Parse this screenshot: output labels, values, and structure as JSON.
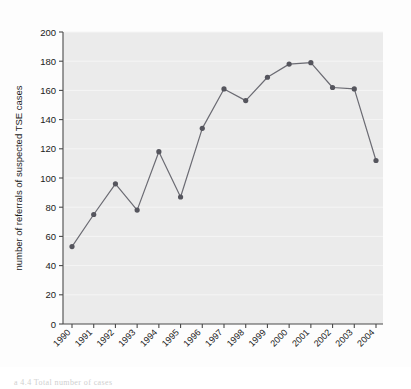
{
  "chart_data": {
    "type": "line",
    "title": "",
    "xlabel": "year",
    "ylabel": "number of referrals of suspected TSE cases",
    "categories": [
      "1990",
      "1991",
      "1992",
      "1993",
      "1994",
      "1995",
      "1996",
      "1997",
      "1998",
      "1999",
      "2000",
      "2001",
      "2002",
      "2003",
      "2004"
    ],
    "values": [
      53,
      75,
      96,
      78,
      118,
      87,
      134,
      161,
      153,
      169,
      178,
      179,
      162,
      161,
      112
    ],
    "series": [
      {
        "name": "referrals of suspected TSE cases",
        "values": [
          53,
          75,
          96,
          78,
          118,
          87,
          134,
          161,
          153,
          169,
          178,
          179,
          162,
          161,
          112
        ]
      }
    ],
    "ylim": [
      0,
      200
    ],
    "yticks": [
      0,
      20,
      40,
      60,
      80,
      100,
      120,
      140,
      160,
      180,
      200
    ],
    "ytick_labels": [
      "0",
      "20",
      "40",
      "60",
      "80",
      "100",
      "120",
      "140",
      "160",
      "180",
      "200"
    ],
    "xtick_labels": [
      "1990",
      "1991",
      "1992",
      "1993",
      "1994",
      "1995",
      "1996",
      "1997",
      "1998",
      "1999",
      "2000",
      "2001",
      "2002",
      "2003",
      "2004"
    ],
    "xtick_rotation_deg": 45,
    "grid": "horizontal",
    "legend": "none",
    "marker": "circle",
    "line_color": "#6b6b73",
    "marker_color": "#55555d",
    "plot_background": "#ebebeb",
    "gridline_color": "#f5f5f5",
    "axis_color": "#4a4a4a",
    "text_color": "#1a1a1a"
  },
  "figure": {
    "caption_fragment": "a 4.4  Total number of cases"
  }
}
